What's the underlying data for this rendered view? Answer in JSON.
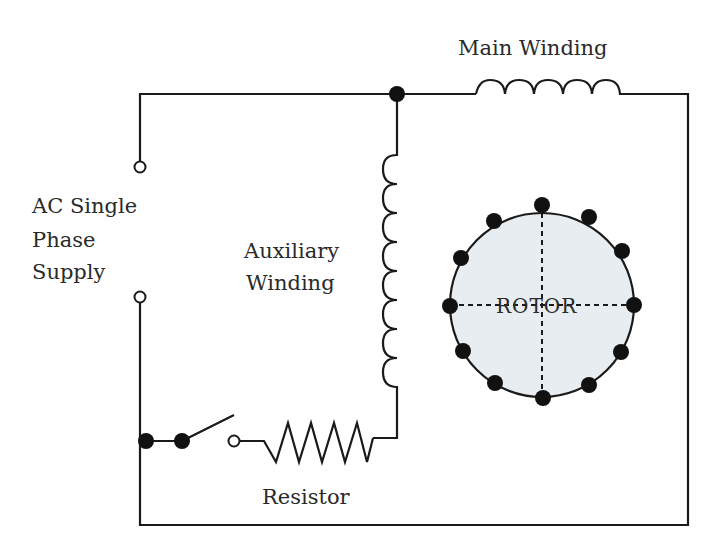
{
  "diagram": {
    "labels": {
      "main_winding": "Main Winding",
      "supply_line1": "AC Single",
      "supply_line2": "Phase",
      "supply_line3": "Supply",
      "aux_line1": "Auxiliary",
      "aux_line2": "Winding",
      "resistor": "Resistor",
      "rotor": "ROTOR"
    },
    "components": [
      "AC single phase supply terminals",
      "Main winding (inductor)",
      "Auxiliary winding (inductor)",
      "Centrifugal switch",
      "Resistor",
      "Rotor"
    ],
    "colors": {
      "line": "#1a1a1a",
      "rotor_fill": "#e8edf2",
      "background": "#ffffff"
    }
  }
}
